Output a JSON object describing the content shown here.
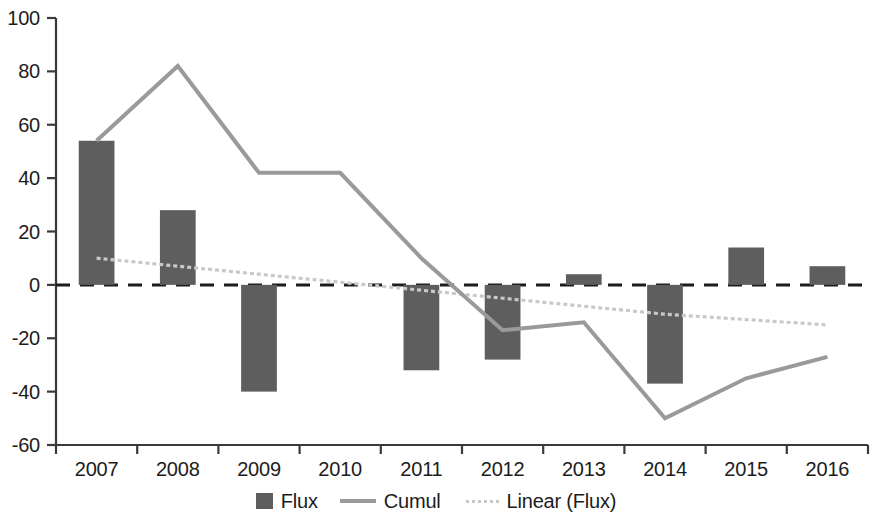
{
  "chart_data": {
    "type": "bar",
    "title": "",
    "subtitle": "",
    "xlabel": "",
    "ylabel": "",
    "categories": [
      "2007",
      "2008",
      "2009",
      "2010",
      "2011",
      "2012",
      "2013",
      "2014",
      "2015",
      "2016"
    ],
    "ylim": [
      -60,
      100
    ],
    "yticks": [
      100,
      80,
      60,
      40,
      20,
      0,
      -20,
      -40,
      -60
    ],
    "grid": false,
    "zero_line": true,
    "legend_position": "bottom",
    "series": [
      {
        "name": "Flux",
        "type": "bar",
        "color": "#5e5e5e",
        "values": [
          54,
          28,
          -40,
          0,
          -32,
          -28,
          4,
          -37,
          14,
          7
        ]
      },
      {
        "name": "Cumul",
        "type": "line",
        "color": "#9a9a9a",
        "values": [
          54,
          82,
          42,
          42,
          10,
          -17,
          -14,
          -50,
          -35,
          -27
        ]
      },
      {
        "name": "Linear (Flux)",
        "type": "line",
        "style": "dotted",
        "color": "#c9c9c9",
        "values": [
          10,
          7,
          4,
          1,
          -2,
          -5,
          -8,
          -11,
          -13,
          -15
        ]
      }
    ]
  },
  "legend": {
    "entries": [
      {
        "label": "Flux",
        "marker": "bar-swatch-icon"
      },
      {
        "label": "Cumul",
        "marker": "solid-line-swatch-icon"
      },
      {
        "label": "Linear (Flux)",
        "marker": "dotted-line-swatch-icon"
      }
    ]
  },
  "axes": {
    "y_tick_labels": [
      "100",
      "80",
      "60",
      "40",
      "20",
      "0",
      "-20",
      "-40",
      "-60"
    ],
    "x_tick_labels": [
      "2007",
      "2008",
      "2009",
      "2010",
      "2011",
      "2012",
      "2013",
      "2014",
      "2015",
      "2016"
    ]
  }
}
